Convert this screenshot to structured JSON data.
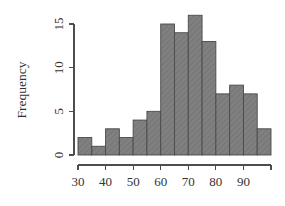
{
  "chart_data": {
    "type": "bar",
    "title": "",
    "subtitle": "",
    "xlabel": "",
    "ylabel": "Frequency",
    "bin_width": 5,
    "bin_edges": [
      30,
      35,
      40,
      45,
      50,
      55,
      60,
      65,
      70,
      75,
      80,
      85,
      90,
      95,
      100
    ],
    "categories": [
      "30-35",
      "35-40",
      "40-45",
      "45-50",
      "50-55",
      "55-60",
      "60-65",
      "65-70",
      "70-75",
      "75-80",
      "80-85",
      "85-90",
      "90-95",
      "95-100"
    ],
    "values": [
      2,
      1,
      3,
      2,
      4,
      5,
      15,
      14,
      16,
      13,
      7,
      8,
      7,
      3
    ],
    "x": [
      32.5,
      37.5,
      42.5,
      47.5,
      52.5,
      57.5,
      62.5,
      67.5,
      72.5,
      77.5,
      82.5,
      87.5,
      92.5,
      97.5
    ],
    "xlim": [
      30,
      100
    ],
    "ylim": [
      0,
      16
    ],
    "xticks": [
      30,
      40,
      50,
      60,
      70,
      80,
      90,
      100
    ],
    "xtick_labels": [
      "30",
      "40",
      "50",
      "60",
      "70",
      "80",
      "90",
      ""
    ],
    "yticks": [
      0,
      5,
      10,
      15
    ],
    "ytick_labels": [
      "0",
      "5",
      "10",
      "15"
    ],
    "grid": false,
    "legend": false,
    "legend_position": "none",
    "bar_fill_color": "#808080",
    "bar_border_color": "#4a4a4a",
    "hatch": "diagonal",
    "axis_color": "#4d4d4d",
    "background_color": "#ffffff"
  }
}
